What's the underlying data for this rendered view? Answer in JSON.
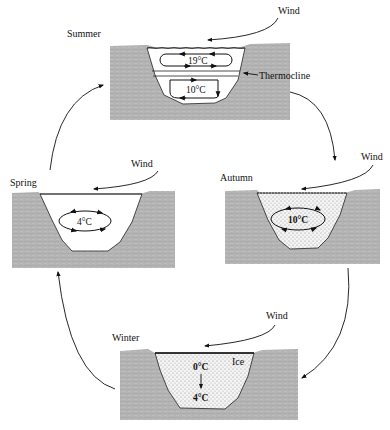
{
  "diagram": {
    "wind_label": "Wind",
    "colors": {
      "ground": "#b9b9b9",
      "water": "#ffffff",
      "stipple": "#9a9a9a",
      "line": "#111111"
    },
    "stages": [
      {
        "id": "summer",
        "season": "Summer",
        "layers": [
          {
            "temp": "19°C",
            "position": "upper"
          },
          {
            "temp": "10°C",
            "position": "lower"
          }
        ],
        "annotation": "Thermocline"
      },
      {
        "id": "autumn",
        "season": "Autumn",
        "layers": [
          {
            "temp": "10°C",
            "position": "mixed"
          }
        ]
      },
      {
        "id": "winter",
        "season": "Winter",
        "surface_label": "Ice",
        "top_temp": "0°C",
        "bottom_temp": "4°C"
      },
      {
        "id": "spring",
        "season": "Spring",
        "layers": [
          {
            "temp": "4°C",
            "position": "mixed"
          }
        ]
      }
    ],
    "cycle_order": [
      "Summer",
      "Autumn",
      "Winter",
      "Spring"
    ]
  }
}
